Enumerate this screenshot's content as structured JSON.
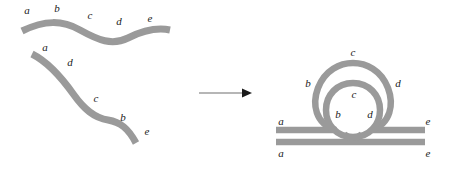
{
  "figure": {
    "colors": {
      "strand": "#9a9a9a",
      "label": "#1a1a1a",
      "arrow": "#1a1a1a",
      "background": "#ffffff"
    }
  },
  "left_panel": {
    "name": "unpaired-strands",
    "strands": [
      {
        "name": "normal-sequence-strand",
        "order": "a-b-c-d-e",
        "labels": [
          {
            "text": "a",
            "x": 27,
            "y": 11
          },
          {
            "text": "b",
            "x": 57,
            "y": 9
          },
          {
            "text": "c",
            "x": 90,
            "y": 16
          },
          {
            "text": "d",
            "x": 119,
            "y": 22
          },
          {
            "text": "e",
            "x": 150,
            "y": 19
          }
        ]
      },
      {
        "name": "inverted-sequence-strand",
        "order": "a-d-c-b-e",
        "labels": [
          {
            "text": "a",
            "x": 45,
            "y": 48
          },
          {
            "text": "d",
            "x": 70,
            "y": 63
          },
          {
            "text": "c",
            "x": 96,
            "y": 99
          },
          {
            "text": "b",
            "x": 123,
            "y": 118
          },
          {
            "text": "e",
            "x": 147,
            "y": 132
          }
        ]
      }
    ]
  },
  "transition": {
    "name": "transformation-arrow",
    "direction": "right"
  },
  "right_panel": {
    "name": "inversion-loop-structure",
    "outer_loop_labels": [
      {
        "text": "c",
        "x": 353,
        "y": 62
      },
      {
        "text": "b",
        "x": 311,
        "y": 84
      },
      {
        "text": "d",
        "x": 395,
        "y": 84
      }
    ],
    "inner_loop_labels": [
      {
        "text": "c",
        "x": 354,
        "y": 93
      },
      {
        "text": "b",
        "x": 337,
        "y": 115
      },
      {
        "text": "d",
        "x": 371,
        "y": 115
      }
    ],
    "flank_labels": [
      {
        "text": "a",
        "x": 281,
        "y": 123
      },
      {
        "text": "a",
        "x": 281,
        "y": 153
      },
      {
        "text": "e",
        "x": 428,
        "y": 123
      },
      {
        "text": "e",
        "x": 428,
        "y": 153
      }
    ]
  }
}
